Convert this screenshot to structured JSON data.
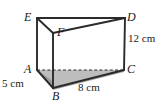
{
  "figure": {
    "name": "triangular-prism",
    "colors": {
      "outline": "#2b2b2b",
      "shading": "#b5b5b5",
      "shading_light": "#c8c8c8",
      "background": "#ffffff",
      "text": "#1a1a1a"
    },
    "vertices": [
      {
        "id": "E",
        "label": "E",
        "x": 37,
        "y": 18
      },
      {
        "id": "D",
        "label": "D",
        "x": 125,
        "y": 18
      },
      {
        "id": "F",
        "label": "F",
        "x": 53,
        "y": 33
      },
      {
        "id": "A",
        "label": "A",
        "x": 37,
        "y": 70
      },
      {
        "id": "C",
        "label": "C",
        "x": 124,
        "y": 70
      },
      {
        "id": "B",
        "label": "B",
        "x": 53,
        "y": 88
      }
    ],
    "edges": [
      {
        "from": "E",
        "to": "D",
        "style": "solid"
      },
      {
        "from": "E",
        "to": "F",
        "style": "solid"
      },
      {
        "from": "F",
        "to": "D",
        "style": "solid"
      },
      {
        "from": "E",
        "to": "A",
        "style": "solid"
      },
      {
        "from": "D",
        "to": "C",
        "style": "solid"
      },
      {
        "from": "F",
        "to": "B",
        "style": "solid"
      },
      {
        "from": "A",
        "to": "B",
        "style": "solid"
      },
      {
        "from": "B",
        "to": "C",
        "style": "solid"
      },
      {
        "from": "A",
        "to": "C",
        "style": "dashed"
      }
    ],
    "dimensions": [
      {
        "id": "height",
        "value": "12 cm",
        "edge": "DC"
      },
      {
        "id": "length",
        "value": "8 cm",
        "edge": "BC"
      },
      {
        "id": "depth",
        "value": "5 cm",
        "edge": "AB"
      }
    ]
  }
}
